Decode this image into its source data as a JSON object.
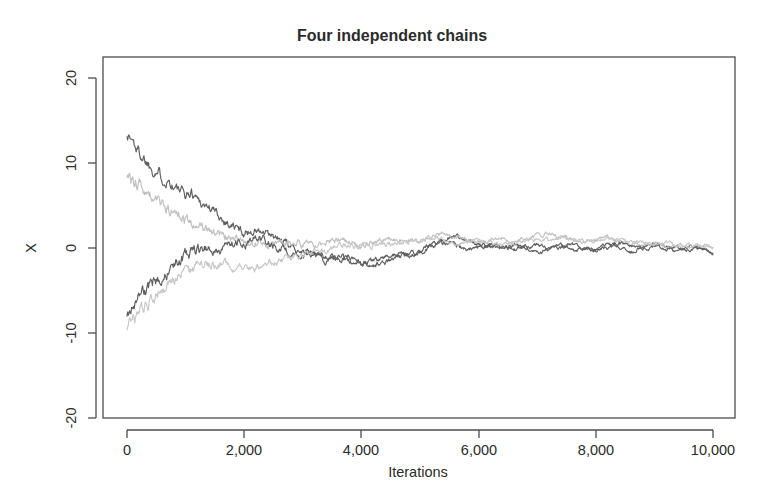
{
  "chart_data": {
    "type": "line",
    "title": "Four independent chains",
    "xlabel": "Iterations",
    "ylabel": "X",
    "xlim": [
      0,
      10000
    ],
    "ylim": [
      -23,
      23
    ],
    "grid": false,
    "legend": "none",
    "xticks": [
      0,
      2000,
      4000,
      6000,
      8000,
      10000
    ],
    "xticklabels": [
      "0",
      "2,000",
      "4,000",
      "6,000",
      "8,000",
      "10,000"
    ],
    "yticks": [
      20,
      10,
      0,
      -10,
      -20
    ],
    "yticklabels": [
      "20",
      "10",
      "0",
      "-10",
      "-20"
    ],
    "series": [
      {
        "name": "chain-1",
        "color": "#5e5e5e",
        "start_value": 13.5,
        "converged_value": -0.5,
        "x": [
          0,
          100,
          200,
          300,
          400,
          500,
          600,
          700,
          800,
          900,
          1000,
          1100,
          1200,
          1300,
          1400,
          1500,
          1600,
          1700,
          1800,
          1900,
          2000,
          2200,
          2400,
          2600,
          2800,
          3000,
          3200,
          3400,
          3600,
          3800,
          4000,
          4200,
          4400,
          4600,
          4800,
          5000,
          5200,
          5400,
          5600,
          5800,
          6000,
          6200,
          6400,
          6600,
          6800,
          7000,
          7200,
          7400,
          7600,
          7800,
          8000,
          8200,
          8400,
          8600,
          8800,
          9000,
          9200,
          9400,
          9600,
          9800,
          10000
        ],
        "y": [
          13.5,
          12.6,
          11.3,
          10.6,
          9.7,
          9.2,
          8.4,
          8.1,
          7.3,
          6.6,
          6.2,
          6.5,
          5.9,
          5.2,
          4.8,
          4.3,
          3.6,
          3.1,
          2.6,
          2.2,
          1.8,
          2.1,
          1.5,
          0.9,
          0.2,
          -0.3,
          -0.6,
          -0.9,
          -1.3,
          -1.0,
          -1.6,
          -2.1,
          -1.7,
          -1.2,
          -0.8,
          -0.4,
          0.3,
          0.9,
          1.5,
          0.8,
          0.4,
          0.1,
          0.3,
          -0.2,
          0.1,
          -0.4,
          -0.1,
          0.2,
          -0.3,
          0.1,
          -0.2,
          0.4,
          0.0,
          -0.5,
          0.2,
          0.5,
          0.1,
          -0.3,
          0.2,
          -0.1,
          -0.5
        ]
      },
      {
        "name": "chain-2",
        "color": "#c0c0c0",
        "start_value": 8.5,
        "converged_value": 0.2,
        "x": [
          0,
          100,
          200,
          300,
          400,
          500,
          600,
          700,
          800,
          900,
          1000,
          1100,
          1200,
          1300,
          1400,
          1500,
          1600,
          1700,
          1800,
          1900,
          2000,
          2200,
          2400,
          2600,
          2800,
          3000,
          3200,
          3400,
          3600,
          3800,
          4000,
          4200,
          4400,
          4600,
          4800,
          5000,
          5200,
          5400,
          5600,
          5800,
          6000,
          6200,
          6400,
          6600,
          6800,
          7000,
          7200,
          7400,
          7600,
          7800,
          8000,
          8200,
          8400,
          8600,
          8800,
          9000,
          9200,
          9400,
          9600,
          9800,
          10000
        ],
        "y": [
          8.5,
          7.9,
          7.4,
          6.8,
          6.1,
          5.6,
          5.1,
          4.7,
          4.2,
          3.8,
          3.4,
          3.0,
          2.7,
          2.3,
          2.0,
          1.7,
          1.4,
          1.2,
          1.0,
          0.8,
          0.7,
          0.5,
          0.4,
          0.6,
          0.8,
          0.5,
          0.3,
          0.6,
          0.9,
          0.7,
          0.4,
          0.6,
          0.9,
          1.1,
          0.8,
          1.0,
          1.3,
          1.6,
          1.2,
          0.9,
          0.6,
          0.9,
          1.2,
          0.8,
          1.1,
          1.4,
          1.7,
          1.3,
          1.0,
          0.7,
          0.9,
          1.2,
          0.8,
          0.5,
          0.3,
          0.6,
          0.2,
          0.4,
          0.1,
          0.3,
          0.2
        ]
      },
      {
        "name": "chain-3",
        "color": "#5e5e5e",
        "start_value": -7.6,
        "converged_value": -0.6,
        "x": [
          0,
          100,
          200,
          300,
          400,
          500,
          600,
          700,
          800,
          900,
          1000,
          1100,
          1200,
          1300,
          1400,
          1500,
          1600,
          1700,
          1800,
          1900,
          2000,
          2200,
          2400,
          2600,
          2800,
          3000,
          3200,
          3400,
          3600,
          3800,
          4000,
          4200,
          4400,
          4600,
          4800,
          5000,
          5200,
          5400,
          5600,
          5800,
          6000,
          6200,
          6400,
          6600,
          6800,
          7000,
          7200,
          7400,
          7600,
          7800,
          8000,
          8200,
          8400,
          8600,
          8800,
          9000,
          9200,
          9400,
          9600,
          9800,
          10000
        ],
        "y": [
          -7.6,
          -6.7,
          -6.0,
          -5.2,
          -4.4,
          -3.8,
          -3.2,
          -2.5,
          -1.9,
          -1.4,
          -0.9,
          -0.5,
          -0.3,
          -0.1,
          0.1,
          0.0,
          -0.2,
          0.1,
          0.3,
          0.6,
          0.4,
          1.3,
          0.7,
          0.2,
          -0.5,
          -1.1,
          -0.7,
          -1.4,
          -0.9,
          -1.5,
          -2.0,
          -1.5,
          -1.1,
          -0.7,
          -0.9,
          -0.5,
          0.2,
          0.7,
          0.3,
          -0.1,
          0.2,
          0.5,
          0.1,
          0.4,
          0.0,
          0.3,
          -0.2,
          0.1,
          0.4,
          0.0,
          -0.3,
          0.1,
          0.5,
          0.2,
          -0.1,
          0.3,
          -0.2,
          0.1,
          -0.4,
          0.0,
          -0.6
        ]
      },
      {
        "name": "chain-4",
        "color": "#c8c8c8",
        "start_value": -9.0,
        "converged_value": 0.1,
        "x": [
          0,
          100,
          200,
          300,
          400,
          500,
          600,
          700,
          800,
          900,
          1000,
          1100,
          1200,
          1300,
          1400,
          1500,
          1600,
          1700,
          1800,
          1900,
          2000,
          2200,
          2400,
          2600,
          2800,
          3000,
          3200,
          3400,
          3600,
          3800,
          4000,
          4200,
          4400,
          4600,
          4800,
          5000,
          5200,
          5400,
          5600,
          5800,
          6000,
          6200,
          6400,
          6600,
          6800,
          7000,
          7200,
          7400,
          7600,
          7800,
          8000,
          8200,
          8400,
          8600,
          8800,
          9000,
          9200,
          9400,
          9600,
          9800,
          10000
        ],
        "y": [
          -9.0,
          -8.2,
          -7.5,
          -6.8,
          -6.0,
          -5.4,
          -4.8,
          -4.3,
          -3.8,
          -3.3,
          -2.9,
          -2.6,
          -2.3,
          -2.1,
          -1.9,
          -1.8,
          -1.9,
          -2.1,
          -2.3,
          -2.2,
          -2.4,
          -2.1,
          -1.8,
          -1.4,
          -1.0,
          -0.7,
          -0.4,
          -0.1,
          0.2,
          0.4,
          0.1,
          0.3,
          0.6,
          0.4,
          0.7,
          0.9,
          1.1,
          0.8,
          0.5,
          0.7,
          1.0,
          0.6,
          0.3,
          0.6,
          0.9,
          1.2,
          0.9,
          1.4,
          1.1,
          0.8,
          1.0,
          1.3,
          0.9,
          0.6,
          0.8,
          0.4,
          0.7,
          0.3,
          0.5,
          0.2,
          0.1
        ]
      }
    ]
  },
  "figure": {
    "title": "Four independent chains",
    "y_axis_label": "X",
    "x_axis_label": "Iterations",
    "x_tick_labels": [
      "0",
      "2,000",
      "4,000",
      "6,000",
      "8,000",
      "10,000"
    ],
    "y_tick_labels": [
      "20",
      "10",
      "0",
      "-10",
      "-20"
    ],
    "frame_color": "#4d4d4d",
    "background_color": "#ffffff",
    "dark_chain_color": "#5e5e5e",
    "light_chain_color": "#c4c4c4"
  }
}
